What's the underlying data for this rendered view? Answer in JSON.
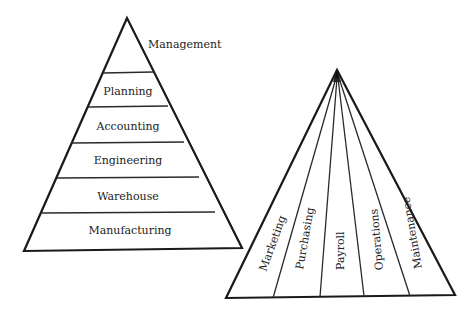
{
  "diagram": {
    "type": "organizational-pyramids",
    "colors": {
      "line": "#1a1a1a",
      "text": "#222222",
      "background": "#ffffff"
    },
    "left_pyramid": {
      "apex_label": "Management",
      "layers": [
        "Planning",
        "Accounting",
        "Engineering",
        "Warehouse",
        "Manufacturing"
      ]
    },
    "right_pyramid": {
      "segments": [
        "Marketing",
        "Purchasing",
        "Payroll",
        "Operations",
        "Maintenance"
      ]
    }
  }
}
